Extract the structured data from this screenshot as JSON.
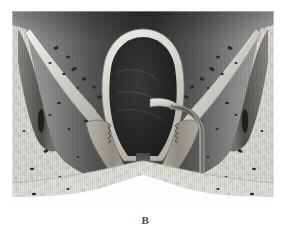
{
  "figure": {
    "caption_label": "B",
    "alt_description": "Grayscale anatomical coronal cross-section illustration",
    "plate": {
      "x": 12,
      "y": 11,
      "width": 262,
      "height": 194
    },
    "palette": {
      "page_background": "#ffffff",
      "bone_light": "#e4e2dd",
      "bone_mid": "#cdcac3",
      "bone_shadow": "#a8a49c",
      "trabecular_speck": "#2b2b2b",
      "cavity_dark": "#262626",
      "cavity_mid": "#555555",
      "mucosa_rim": "#d8d5ce",
      "lateral_mass": "#6f6d68",
      "lateral_mass_dark": "#4a4843",
      "septum_line": "#8a8780",
      "caption_text": "#4a4a4a",
      "backdrop_gradient_dark": "#3a3a3a",
      "backdrop_gradient_light": "#bdbdbd"
    },
    "regions": [
      {
        "name": "upper-backdrop",
        "description": "dark vertical gradient band across top"
      },
      {
        "name": "central-cavity",
        "description": "large dark oval airway cavity at center"
      },
      {
        "name": "cavity-rim",
        "description": "light mucosal rim outlining central cavity"
      },
      {
        "name": "left-trabecular-bone",
        "description": "speckled cancellous bone, left side"
      },
      {
        "name": "right-trabecular-bone",
        "description": "speckled cancellous bone, right side"
      },
      {
        "name": "left-lateral-mass",
        "description": "elongated dark lateral soft-tissue mass, left"
      },
      {
        "name": "right-lateral-mass",
        "description": "elongated dark lateral soft-tissue mass, right"
      },
      {
        "name": "left-oblique-lamina",
        "description": "thin oblique bony lamina, left"
      },
      {
        "name": "right-oblique-lamina",
        "description": "thin oblique bony lamina, right"
      },
      {
        "name": "midline-septum",
        "description": "vertical midline septum below cavity"
      },
      {
        "name": "left-turbinate-fold",
        "description": "scalloped fold descending left of midline"
      },
      {
        "name": "right-turbinate-fold",
        "description": "scalloped fold descending right of midline"
      },
      {
        "name": "right-duct-tube",
        "description": "curved tubular duct on right descending to base"
      },
      {
        "name": "inferior-bone-shelf",
        "description": "pale bone shelf forming lower floor"
      }
    ]
  }
}
